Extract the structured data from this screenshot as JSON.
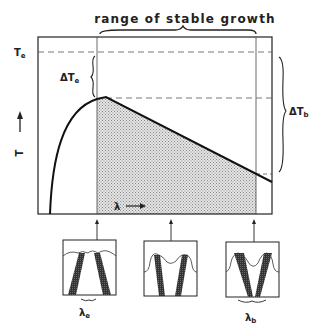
{
  "diagram": {
    "title": "range of stable growth",
    "y_axis_label": "T",
    "x_axis_label": "λ",
    "labels": {
      "T_e": {
        "main": "T",
        "sub": "e"
      },
      "delta_T_e": {
        "main": "ΔT",
        "sub": "e"
      },
      "delta_T_b": {
        "main": "ΔT",
        "sub": "b"
      },
      "lambda_e": {
        "main": "λ",
        "sub": "e"
      },
      "lambda_b": {
        "main": "λ",
        "sub": "b"
      }
    },
    "colors": {
      "line": "#222222",
      "shade": "#bdbdbd",
      "background": "#ffffff"
    },
    "panels": [
      {
        "name": "panel-lambda-e",
        "description": "narrow spacing, shallow cells"
      },
      {
        "name": "panel-middle",
        "description": "intermediate spacing"
      },
      {
        "name": "panel-lambda-b",
        "description": "wide spacing, deep cells"
      }
    ]
  }
}
